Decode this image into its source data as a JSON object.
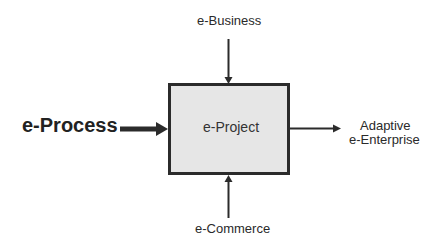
{
  "diagram": {
    "type": "input-process-output",
    "center": {
      "label": "e-Project",
      "fill": "#e6e6e6",
      "border": "#2b2b2b"
    },
    "input": {
      "label": "e-Process"
    },
    "output": {
      "label_line1": "Adaptive",
      "label_line2": "e-Enterprise"
    },
    "top_control": {
      "label": "e-Business"
    },
    "bottom_mechanism": {
      "label": "e-Commerce"
    },
    "colors": {
      "stroke": "#2b2b2b",
      "text": "#2a2a2a",
      "background": "#ffffff"
    }
  }
}
